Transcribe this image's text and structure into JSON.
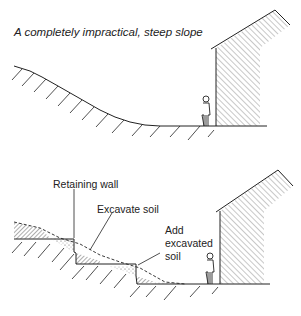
{
  "top_panel": {
    "title": "A completely impractical, steep slope"
  },
  "bottom_panel": {
    "labels": {
      "retaining_wall": "Retaining wall",
      "excavate_soil": "Excavate soil",
      "add_soil_line1": "Add",
      "add_soil_line2": "excavated",
      "add_soil_line3": "soil"
    }
  },
  "colors": {
    "ink": "#222222",
    "background": "#ffffff"
  }
}
